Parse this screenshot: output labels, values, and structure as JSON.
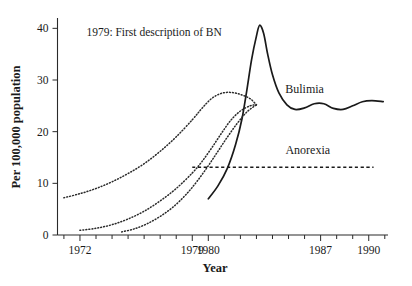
{
  "chart_data": {
    "type": "line",
    "title": "",
    "xlabel": "Year",
    "ylabel": "Per 100,000 population",
    "xlim": [
      1970.6,
      1991.2
    ],
    "ylim": [
      0,
      42
    ],
    "grid": false,
    "legend_position": "inline-labels",
    "yticks": [
      0,
      10,
      20,
      30,
      40
    ],
    "ytick_labels": [
      "0",
      "10",
      "20",
      "30",
      "40"
    ],
    "xticks": [
      1972,
      1979,
      1980,
      1987,
      1990
    ],
    "xtick_labels": [
      "1972",
      "1979",
      "1980",
      "1987",
      "1990"
    ],
    "xtick_minor_step": 1,
    "annotations": [
      {
        "text": "1979:  First description of BN",
        "x": 1972.4,
        "y": 38.5
      }
    ],
    "series": [
      {
        "name": "Bulimia",
        "style": "solid",
        "label": "Bulimia",
        "label_x": 1986.0,
        "label_y": 27.5,
        "points": [
          [
            1980.0,
            7.0
          ],
          [
            1980.6,
            9.5
          ],
          [
            1981.2,
            13.0
          ],
          [
            1981.7,
            17.5
          ],
          [
            1982.1,
            22.5
          ],
          [
            1982.4,
            28.0
          ],
          [
            1982.7,
            34.0
          ],
          [
            1983.0,
            38.5
          ],
          [
            1983.2,
            40.6
          ],
          [
            1983.45,
            39.0
          ],
          [
            1983.7,
            35.0
          ],
          [
            1984.0,
            31.0
          ],
          [
            1984.4,
            27.5
          ],
          [
            1984.9,
            25.2
          ],
          [
            1985.4,
            24.3
          ],
          [
            1986.0,
            24.6
          ],
          [
            1986.6,
            25.4
          ],
          [
            1987.2,
            25.4
          ],
          [
            1987.8,
            24.5
          ],
          [
            1988.4,
            24.3
          ],
          [
            1989.0,
            25.0
          ],
          [
            1989.6,
            25.8
          ],
          [
            1990.2,
            26.0
          ],
          [
            1990.9,
            25.8
          ]
        ]
      },
      {
        "name": "Projection upper",
        "style": "dotted",
        "points": [
          [
            1971.0,
            7.2
          ],
          [
            1972.0,
            8.0
          ],
          [
            1973.0,
            9.0
          ],
          [
            1974.0,
            10.3
          ],
          [
            1975.0,
            11.9
          ],
          [
            1976.0,
            13.8
          ],
          [
            1977.0,
            16.2
          ],
          [
            1978.0,
            19.0
          ],
          [
            1979.0,
            22.3
          ],
          [
            1979.6,
            24.5
          ],
          [
            1980.2,
            26.4
          ],
          [
            1980.8,
            27.4
          ],
          [
            1981.4,
            27.6
          ],
          [
            1982.0,
            27.2
          ],
          [
            1982.6,
            26.4
          ],
          [
            1983.0,
            25.2
          ]
        ]
      },
      {
        "name": "Projection middle",
        "style": "dotted",
        "points": [
          [
            1972.0,
            0.9
          ],
          [
            1973.0,
            1.3
          ],
          [
            1974.0,
            2.0
          ],
          [
            1975.0,
            3.1
          ],
          [
            1976.0,
            4.6
          ],
          [
            1977.0,
            6.6
          ],
          [
            1978.0,
            9.0
          ],
          [
            1979.0,
            12.0
          ],
          [
            1979.6,
            14.2
          ],
          [
            1980.2,
            16.8
          ],
          [
            1980.8,
            19.6
          ],
          [
            1981.4,
            22.2
          ],
          [
            1982.0,
            24.0
          ],
          [
            1982.6,
            25.0
          ],
          [
            1983.0,
            25.2
          ]
        ]
      },
      {
        "name": "Projection lower",
        "style": "dotted",
        "points": [
          [
            1974.6,
            0.6
          ],
          [
            1975.4,
            1.2
          ],
          [
            1976.2,
            2.2
          ],
          [
            1977.0,
            3.6
          ],
          [
            1977.8,
            5.4
          ],
          [
            1978.6,
            7.8
          ],
          [
            1979.3,
            10.4
          ],
          [
            1980.0,
            13.4
          ],
          [
            1980.6,
            16.2
          ],
          [
            1981.2,
            19.0
          ],
          [
            1981.8,
            21.6
          ],
          [
            1982.4,
            23.8
          ],
          [
            1983.0,
            25.2
          ]
        ]
      },
      {
        "name": "Anorexia",
        "style": "dashed",
        "label": "Anorexia",
        "label_x": 1986.2,
        "label_y": 15.6,
        "points": [
          [
            1979.0,
            13.1
          ],
          [
            1990.3,
            13.1
          ]
        ]
      }
    ]
  },
  "axis_titles": {
    "x": "Year",
    "y": "Per 100,000 population"
  }
}
